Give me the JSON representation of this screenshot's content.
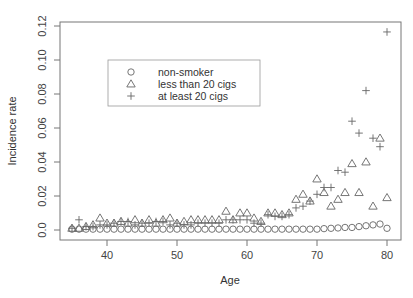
{
  "chart_data": {
    "type": "scatter",
    "title": "",
    "xlabel": "Age",
    "ylabel": "Incidence rate",
    "xlim": [
      34,
      82
    ],
    "ylim": [
      -0.006,
      0.122
    ],
    "x_ticks": [
      40,
      50,
      60,
      70,
      80
    ],
    "x_tick_labels": [
      "40",
      "50",
      "60",
      "70",
      "80"
    ],
    "y_ticks": [
      0.0,
      0.02,
      0.04,
      0.06,
      0.08,
      0.1,
      0.12
    ],
    "y_tick_labels": [
      "0.0",
      "0.02",
      "0.04",
      "0.06",
      "0.08",
      "0.10",
      "0.12"
    ],
    "grid": false,
    "legend_position": "upper-left (inset box)",
    "legend": [
      {
        "label": "non-smoker",
        "marker": "circle"
      },
      {
        "label": "less than 20 cigs",
        "marker": "triangle"
      },
      {
        "label": "at least 20 cigs",
        "marker": "plus"
      }
    ],
    "x": [
      35,
      36,
      37,
      38,
      39,
      40,
      41,
      42,
      43,
      44,
      45,
      46,
      47,
      48,
      49,
      50,
      51,
      52,
      53,
      54,
      55,
      56,
      57,
      58,
      59,
      60,
      61,
      62,
      63,
      64,
      65,
      66,
      67,
      68,
      69,
      70,
      71,
      72,
      73,
      74,
      75,
      76,
      77,
      78,
      79,
      80
    ],
    "series": [
      {
        "name": "non-smoker",
        "marker": "circle",
        "values": [
          0.0005,
          0.0005,
          0.0005,
          0.0005,
          0.0005,
          0.0005,
          0.0005,
          0.0005,
          0.0005,
          0.0005,
          0.0005,
          0.0005,
          0.0005,
          0.0005,
          0.0005,
          0.0005,
          0.0005,
          0.0005,
          0.0005,
          0.0005,
          0.0005,
          0.0005,
          0.0005,
          0.0005,
          0.0005,
          0.0005,
          0.0005,
          0.0005,
          0.0005,
          0.0005,
          0.0005,
          0.0005,
          0.0005,
          0.0005,
          0.0005,
          0.0005,
          0.0008,
          0.001,
          0.0012,
          0.0015,
          0.0015,
          0.002,
          0.0025,
          0.003,
          0.0035,
          0.001
        ]
      },
      {
        "name": "less than 20 cigs",
        "marker": "triangle",
        "values": [
          0.001,
          0.001,
          0.002,
          0.003,
          0.007,
          0.004,
          0.004,
          0.005,
          0.004,
          0.006,
          0.004,
          0.006,
          0.004,
          0.006,
          0.007,
          0.004,
          0.005,
          0.006,
          0.006,
          0.006,
          0.006,
          0.006,
          0.011,
          0.006,
          0.01,
          0.01,
          0.007,
          0.005,
          0.01,
          0.01,
          0.009,
          0.01,
          0.018,
          0.021,
          0.017,
          0.03,
          0.022,
          0.014,
          0.018,
          0.022,
          0.039,
          0.022,
          0.04,
          0.014,
          0.054,
          0.019
        ]
      },
      {
        "name": "at least 20 cigs",
        "marker": "plus",
        "values": [
          0.001,
          0.006,
          0.002,
          0.002,
          0.003,
          0.003,
          0.004,
          0.005,
          0.005,
          0.003,
          0.004,
          0.004,
          0.005,
          0.005,
          0.003,
          0.004,
          0.003,
          0.003,
          0.004,
          0.004,
          0.004,
          0.004,
          0.006,
          0.006,
          0.006,
          0.006,
          0.004,
          0.004,
          0.009,
          0.008,
          0.008,
          0.009,
          0.013,
          0.014,
          0.017,
          0.021,
          0.025,
          0.025,
          0.035,
          0.034,
          0.064,
          0.057,
          0.082,
          0.054,
          0.049,
          0.1165
        ]
      }
    ]
  }
}
